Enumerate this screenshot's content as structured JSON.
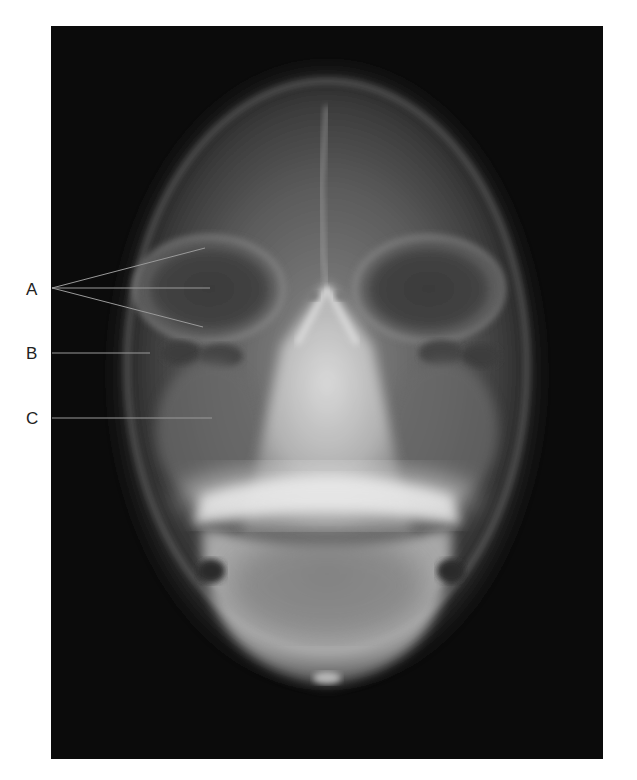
{
  "figure": {
    "type": "radiograph",
    "view": "frontal skull x-ray",
    "labels": [
      {
        "id": "A",
        "text": "A",
        "x": 30,
        "y": 290,
        "pointers": [
          [
            205,
            248
          ],
          [
            210,
            288
          ],
          [
            203,
            327
          ]
        ]
      },
      {
        "id": "B",
        "text": "B",
        "x": 30,
        "y": 353,
        "pointers": [
          [
            150,
            353
          ]
        ]
      },
      {
        "id": "C",
        "text": "C",
        "x": 30,
        "y": 418,
        "pointers": [
          [
            212,
            418
          ]
        ]
      }
    ],
    "colors": {
      "background": "#ffffff",
      "film": "#0b0b0b",
      "bone": "#d8d8d8",
      "leader_line": "#9a9a9a",
      "label_text": "#222222"
    }
  }
}
